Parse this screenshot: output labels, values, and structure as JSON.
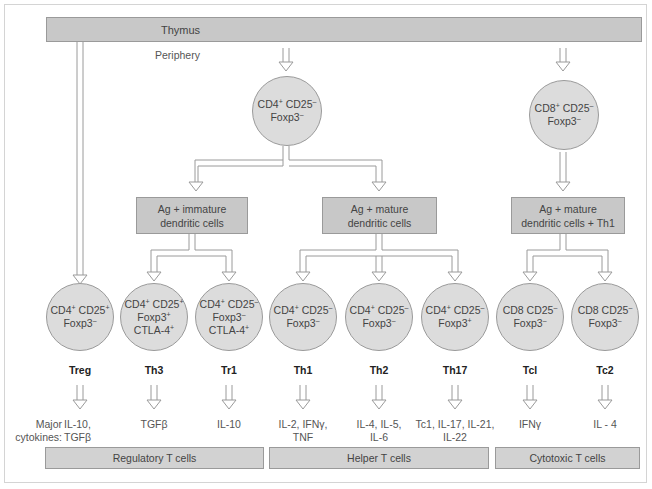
{
  "thymus": {
    "label": "Thymus"
  },
  "periphery": {
    "label": "Periphery"
  },
  "naive_cd4": {
    "line1": "CD4",
    "sup1": "+",
    "mid1": " CD25",
    "sup2": "–",
    "line2": "Foxp3",
    "sup3": "–"
  },
  "naive_cd8": {
    "line1": "CD8",
    "sup1": "+",
    "mid1": " CD25",
    "sup2": "–",
    "line2": "Foxp3",
    "sup3": "–"
  },
  "stimuli": [
    {
      "text": "Ag + immature\ndendritic cells"
    },
    {
      "text": "Ag + mature\ndendritic cells"
    },
    {
      "text": "Ag + mature\ndendritic cells + Th1"
    }
  ],
  "subsets": [
    {
      "name": "Treg",
      "marker_l1": "CD4",
      "s1": "+",
      "marker_l1b": " CD25",
      "s2": "+",
      "marker_l2": "Foxp3",
      "s3": "–",
      "marker_l3": "",
      "s4": "",
      "cytokines": "IL-10,\nTGFβ"
    },
    {
      "name": "Th3",
      "marker_l1": "CD4",
      "s1": "+",
      "marker_l1b": " CD25",
      "s2": "+",
      "marker_l2": "Foxp3",
      "s3": "+",
      "marker_l3": "CTLA-4",
      "s4": "+",
      "cytokines": "TGFβ"
    },
    {
      "name": "Tr1",
      "marker_l1": "CD4",
      "s1": "+",
      "marker_l1b": " CD25",
      "s2": "–",
      "marker_l2": "Foxp3",
      "s3": "–",
      "marker_l3": "CTLA-4",
      "s4": "+",
      "cytokines": "IL-10"
    },
    {
      "name": "Th1",
      "marker_l1": "CD4",
      "s1": "+",
      "marker_l1b": " CD25",
      "s2": "–",
      "marker_l2": "Foxp3",
      "s3": "–",
      "marker_l3": "",
      "s4": "",
      "cytokines": "IL-2, IFNγ,\nTNF"
    },
    {
      "name": "Th2",
      "marker_l1": "CD4",
      "s1": "+",
      "marker_l1b": " CD25",
      "s2": "–",
      "marker_l2": "Foxp3",
      "s3": "–",
      "marker_l3": "",
      "s4": "",
      "cytokines": "IL-4, IL-5,\nIL-6"
    },
    {
      "name": "Th17",
      "marker_l1": "CD4",
      "s1": "+",
      "marker_l1b": " CD25",
      "s2": "–",
      "marker_l2": "Foxp3",
      "s3": "+",
      "marker_l3": "",
      "s4": "",
      "cytokines": "Tc1, IL-17, IL-21,\nIL-22"
    },
    {
      "name": "Tcl",
      "marker_l1": "CD8",
      "s1": "",
      "marker_l1b": " CD25",
      "s2": "–",
      "marker_l2": "Foxp3",
      "s3": "–",
      "marker_l3": "",
      "s4": "",
      "cytokines": "IFNγ"
    },
    {
      "name": "Tc2",
      "marker_l1": "CD8",
      "s1": "",
      "marker_l1b": " CD25",
      "s2": "–",
      "marker_l2": "Foxp3",
      "s3": "–",
      "marker_l3": "",
      "s4": "",
      "cytokines": "IL - 4"
    }
  ],
  "major_cytokines_label": "Major\ncytokines:",
  "categories": [
    {
      "label": "Regulatory T cells"
    },
    {
      "label": "Helper T cells"
    },
    {
      "label": "Cytotoxic T cells"
    }
  ],
  "colors": {
    "box_fill": "#c8c8c8",
    "circle_fill": "#dcdcdc",
    "stroke": "#9a9a9a"
  }
}
